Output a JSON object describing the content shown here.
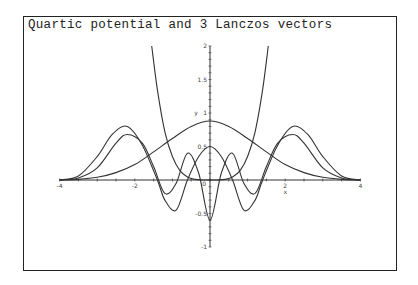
{
  "chart_data": {
    "type": "line",
    "title": "Quartic potential and 3 Lanczos vectors",
    "xlabel": "x",
    "ylabel": "y",
    "xlim": [
      -4,
      4
    ],
    "ylim": [
      -1,
      2
    ],
    "x_ticks": [
      "-4",
      "-2",
      "0",
      "2",
      "4"
    ],
    "y_ticks": [
      "-1",
      "-0.5",
      "0.5",
      "1",
      "1.5",
      "2"
    ],
    "grid": false,
    "legend": null,
    "series": [
      {
        "name": "quartic potential",
        "x": [
          -1.55,
          -1.4,
          -1.2,
          -1.0,
          -0.8,
          -0.6,
          -0.4,
          -0.2,
          0,
          0.2,
          0.4,
          0.6,
          0.8,
          1.0,
          1.2,
          1.4,
          1.55
        ],
        "y": [
          2.0,
          1.35,
          0.72,
          0.35,
          0.14,
          0.045,
          0.009,
          0.0006,
          0,
          0.0006,
          0.009,
          0.045,
          0.14,
          0.35,
          0.72,
          1.35,
          2.0
        ]
      },
      {
        "name": "lanczos vector 1",
        "x": [
          -4,
          -3.5,
          -3,
          -2.5,
          -2,
          -1.5,
          -1,
          -0.5,
          0,
          0.5,
          1,
          1.5,
          2,
          2.5,
          3,
          3.5,
          4
        ],
        "y": [
          0.0,
          0.01,
          0.04,
          0.11,
          0.23,
          0.42,
          0.62,
          0.8,
          0.88,
          0.8,
          0.62,
          0.42,
          0.23,
          0.11,
          0.04,
          0.01,
          0.0
        ]
      },
      {
        "name": "lanczos vector 2",
        "x": [
          -4,
          -3.5,
          -3,
          -2.6,
          -2.2,
          -1.8,
          -1.4,
          -1.2,
          -0.9,
          -0.6,
          -0.3,
          0,
          0.3,
          0.6,
          0.9,
          1.2,
          1.4,
          1.8,
          2.2,
          2.6,
          3,
          3.5,
          4
        ],
        "y": [
          0.0,
          0.06,
          0.35,
          0.68,
          0.8,
          0.52,
          0.0,
          -0.3,
          -0.45,
          0.0,
          0.35,
          0.5,
          0.35,
          0.0,
          -0.45,
          -0.3,
          0.0,
          0.52,
          0.8,
          0.68,
          0.35,
          0.06,
          0.0
        ]
      },
      {
        "name": "lanczos vector 3",
        "x": [
          -4,
          -3.5,
          -3,
          -2.5,
          -2.2,
          -1.8,
          -1.5,
          -1.2,
          -0.9,
          -0.6,
          -0.3,
          0,
          0.3,
          0.6,
          0.9,
          1.2,
          1.5,
          1.8,
          2.2,
          2.5,
          3,
          3.5,
          4
        ],
        "y": [
          0.0,
          0.03,
          0.18,
          0.55,
          0.68,
          0.55,
          0.2,
          -0.2,
          -0.05,
          0.4,
          0.1,
          -0.6,
          0.1,
          0.4,
          -0.05,
          -0.2,
          0.2,
          0.55,
          0.68,
          0.55,
          0.18,
          0.03,
          0.0
        ]
      }
    ]
  },
  "frame": {
    "border_color": "#222222",
    "line_color": "#333333"
  }
}
